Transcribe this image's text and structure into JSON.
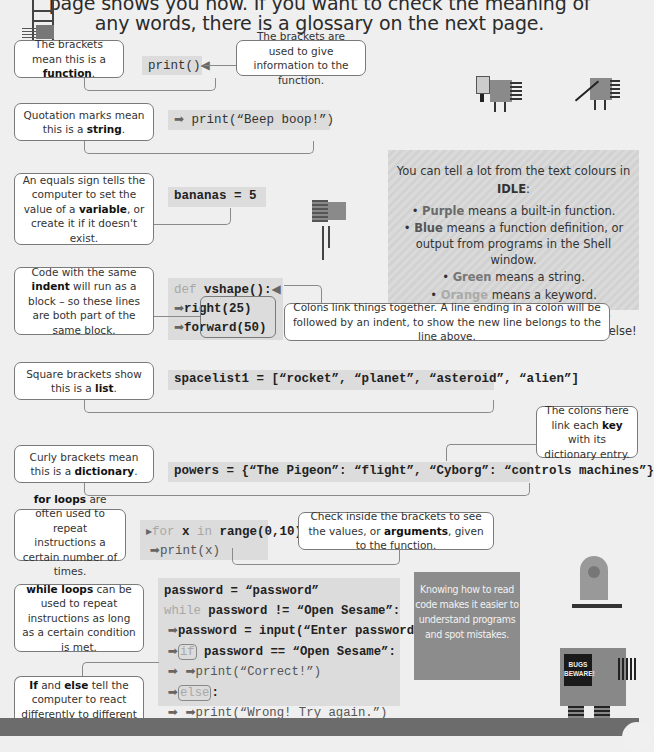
{
  "header": {
    "line1": "page shows you how. If you want to check the meaning of",
    "line2": "any words, there is a glossary on the next page."
  },
  "callouts": {
    "function": {
      "pre": "The brackets mean this is a ",
      "bold": "function",
      "post": "."
    },
    "brackets_info": {
      "text": "The brackets are used to give information to the function."
    },
    "string": {
      "pre": "Quotation marks mean this is a ",
      "bold": "string",
      "post": "."
    },
    "variable": {
      "pre": "An equals sign tells the computer to set the value of a ",
      "bold": "variable",
      "post": ", or create it if it doesn't exist."
    },
    "indent": {
      "pre": "Code with the same ",
      "bold": "indent",
      "post": " will run as a block – so these lines are both part of the same block."
    },
    "colons": {
      "text": "Colons link things together. A line ending in a colon will be followed by an indent, to show the new line belongs to the line above."
    },
    "list": {
      "pre": "Square brackets show this is a ",
      "bold": "list",
      "post": "."
    },
    "dict_colons": {
      "pre": "The colons here link each ",
      "bold": "key",
      "post": " with its dictionary entry."
    },
    "dictionary": {
      "pre": "Curly brackets mean this is a ",
      "bold": "dictionary",
      "post": "."
    },
    "for_loops": {
      "bold": "for loops",
      "post": " are often used to repeat instructions a certain number of times."
    },
    "arguments": {
      "pre": "Check inside the brackets to see the values, or ",
      "bold": "arguments",
      "post": ", given to the function."
    },
    "while_loops": {
      "bold": "while loops",
      "post": " can be used to repeat instructions as long as a certain condition is met."
    },
    "if_else": {
      "bold1": "If",
      "mid": " and ",
      "bold2": "else",
      "post": " tell the computer to react differently to different conditions."
    }
  },
  "code": {
    "print_empty": "print()",
    "print_beep": "print(“Beep boop!”)",
    "bananas": "bananas = 5",
    "def_kw": "def",
    "def_name": " vshape():",
    "right": "right(25)",
    "forward": "forward(50)",
    "spacelist": "spacelist1 = [“rocket”, “planet”, “asteroid”, “alien”]",
    "powers": "powers = {“The Pigeon”: “flight”, “Cyborg”: “controls machines”}",
    "for_kw": "for",
    "for_x": " x ",
    "in_kw": "in",
    "for_range": " range(0,10):",
    "print_x": "print(x)",
    "password_assign": "password = “password”",
    "while_kw": "while",
    "while_cond": " password != “Open Sesame”:",
    "password_input": "password = input(“Enter password.”)",
    "if_kw": "if",
    "if_cond": " password == “Open Sesame”:",
    "print_correct": "print(“Correct!”)",
    "else_kw": "else",
    "else_colon": ":",
    "print_wrong": "print(“Wrong! Try again.”)"
  },
  "idle_box": {
    "intro_pre": "You can tell a lot from the text colours in ",
    "intro_bold": "IDLE",
    "intro_post": ":",
    "items": [
      {
        "bold": "Purple",
        "text": " means a built-in function."
      },
      {
        "bold": "Blue",
        "text": " means a function definition, or output from programs in the Shell window."
      },
      {
        "bold": "Green",
        "text": " means a string."
      },
      {
        "bold": "Orange",
        "text": " means a keyword."
      },
      {
        "bold": "Red",
        "text": " is used for error messages."
      },
      {
        "bold": "Black",
        "text": " means just about everything else!"
      }
    ],
    "colors": {
      "purple": "#7a3fa0",
      "blue": "#2a58b8",
      "green": "#2e8b3a",
      "orange": "#e58a2a",
      "red": "#d02020",
      "black": "#111111"
    }
  },
  "robot_note": {
    "text": "Knowing how to read code makes it easier to understand programs and spot mistakes.",
    "badge": "BUGS BEWARE!"
  }
}
